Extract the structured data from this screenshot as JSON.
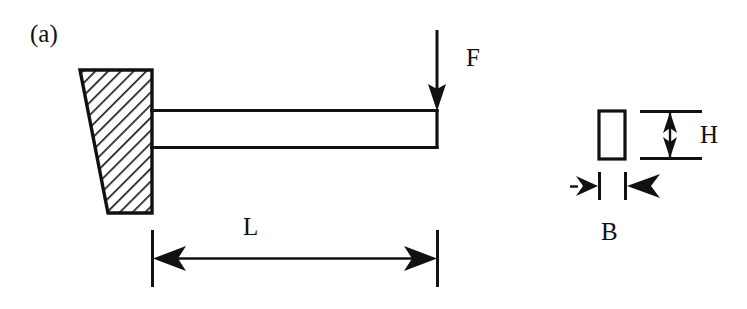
{
  "figure": {
    "panel_label": "(a)",
    "labels": {
      "force": "F",
      "length": "L",
      "height": "H",
      "breadth": "B"
    },
    "colors": {
      "line": "#111111",
      "background": "#ffffff",
      "hatch": "#111111"
    },
    "elements": {
      "support_block_name": "fixed-wall-support",
      "beam_name": "cantilever-beam",
      "force_arrow_name": "force-arrow",
      "length_dimension_name": "length-dimension",
      "cross_section_name": "cross-section-rectangle",
      "height_dimension_name": "height-dimension",
      "breadth_dimension_name": "breadth-dimension"
    },
    "geometry": {
      "support": {
        "top_left_x": 80,
        "top_y": 70,
        "bottom_left_x": 108,
        "bottom_y": 213,
        "right_x": 152
      },
      "beam": {
        "left_x": 152,
        "right_x": 437,
        "top_y": 110,
        "bottom_y": 148
      },
      "force_arrow": {
        "x": 437,
        "top_y": 30,
        "tip_y": 110
      },
      "length_dim": {
        "left_x": 152,
        "right_x": 437,
        "y": 258
      },
      "cross_section": {
        "left_x": 598,
        "right_x": 626,
        "top_y": 110,
        "bottom_y": 160
      },
      "height_dim": {
        "x": 670,
        "top_y": 110,
        "bottom_y": 160
      },
      "breadth_dim": {
        "left_x": 598,
        "right_x": 626,
        "y": 186
      }
    }
  }
}
